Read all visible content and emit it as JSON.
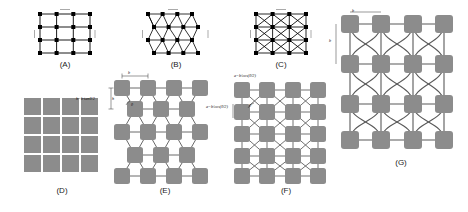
{
  "figure": {
    "background": "#ffffff",
    "node_fill_gray": "#8c8c8c",
    "node_fill_black": "#000000",
    "line_color": "#4d4d4d",
    "line_color_dark": "#000000"
  },
  "panels": [
    {
      "id": "A",
      "label": "(A)",
      "type": "square-lattice-point",
      "rows": 4,
      "cols": 4,
      "node_style": "black-square-dot",
      "edges": "orthogonal",
      "dim_labels": []
    },
    {
      "id": "B",
      "label": "(B)",
      "type": "triangular-lattice-point",
      "rows": 4,
      "cols": 4,
      "node_style": "black-square-dot",
      "edges": "triangular",
      "dim_labels": []
    },
    {
      "id": "C",
      "label": "(C)",
      "type": "square-lattice-with-diagonals-point",
      "rows": 4,
      "cols": 4,
      "node_style": "black-square-dot",
      "edges": "orthogonal-plus-diagonals",
      "dim_labels": []
    },
    {
      "id": "D",
      "label": "(D)",
      "type": "square-block-grid",
      "rows": 4,
      "cols": 4,
      "node_style": "gray-square",
      "edges": "none-abutting",
      "dim_labels": []
    },
    {
      "id": "E",
      "label": "(E)",
      "type": "staggered-network",
      "rows": 5,
      "cols": 4,
      "node_style": "gray-rounded-square",
      "edges": "orthogonal-and-diagonal-staggered",
      "dim_labels": [
        {
          "name": "top-span",
          "text": "b"
        },
        {
          "name": "left-height",
          "text": "h"
        },
        {
          "name": "left-relation",
          "text": "h=b·tanθ/2"
        },
        {
          "name": "right-relation",
          "text": "a=b/cos(θ/2)"
        },
        {
          "name": "angle",
          "text": "θ"
        }
      ]
    },
    {
      "id": "F",
      "label": "(F)",
      "type": "crossed-diagonal-network",
      "rows": 5,
      "cols": 4,
      "node_style": "gray-rounded-square",
      "edges": "orthogonal-plus-full-diagonals",
      "dim_labels": [
        {
          "name": "top-relation",
          "text": "a=b/cos(θ/2)"
        },
        {
          "name": "angle",
          "text": "θ"
        }
      ]
    },
    {
      "id": "G",
      "label": "(G)",
      "type": "curved-link-network",
      "rows": 4,
      "cols": 4,
      "node_style": "gray-rounded-square",
      "edges": "curved-bezier",
      "dim_labels": [
        {
          "name": "top-span",
          "text": "b"
        },
        {
          "name": "left-span",
          "text": "b"
        }
      ]
    }
  ]
}
